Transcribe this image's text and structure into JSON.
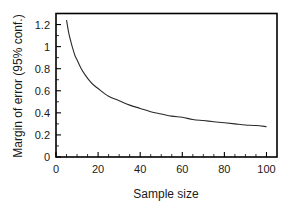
{
  "figure": {
    "background_color": "#ffffff",
    "line_color": "#2a2a2a",
    "axis_color": "#000000"
  },
  "chart_data": {
    "type": "line",
    "title": "",
    "subtitle": "",
    "xlabel": "Sample size",
    "ylabel": "Margin of error (95% conf.)",
    "xlim": [
      0,
      105
    ],
    "ylim": [
      0,
      1.3
    ],
    "grid": false,
    "legend": null,
    "legend_position": "none",
    "x_ticks": [
      0,
      20,
      40,
      60,
      80,
      100
    ],
    "x_tick_labels": [
      "0",
      "20",
      "40",
      "60",
      "80",
      "100"
    ],
    "x_minor_tick_step": 5,
    "y_ticks": [
      0,
      0.2,
      0.4,
      0.6,
      0.8,
      1,
      1.2
    ],
    "y_tick_labels": [
      "0",
      "0.2",
      "0.4",
      "0.6",
      "0.8",
      "1",
      "1.2"
    ],
    "y_minor_tick_step": 0.1,
    "series": [
      {
        "name": "Margin of error",
        "x": [
          5,
          6,
          7,
          8,
          9,
          10,
          12,
          14,
          16,
          18,
          20,
          25,
          30,
          35,
          40,
          45,
          50,
          55,
          60,
          65,
          70,
          75,
          80,
          85,
          90,
          95,
          100
        ],
        "values": [
          1.24,
          1.13,
          1.05,
          0.98,
          0.92,
          0.88,
          0.8,
          0.74,
          0.69,
          0.65,
          0.62,
          0.55,
          0.51,
          0.47,
          0.44,
          0.41,
          0.39,
          0.37,
          0.36,
          0.34,
          0.33,
          0.32,
          0.31,
          0.3,
          0.29,
          0.285,
          0.275
        ]
      }
    ],
    "annotations": []
  },
  "axes": {
    "x_title": "Sample size",
    "y_title": "Margin of error (95% conf.)"
  }
}
